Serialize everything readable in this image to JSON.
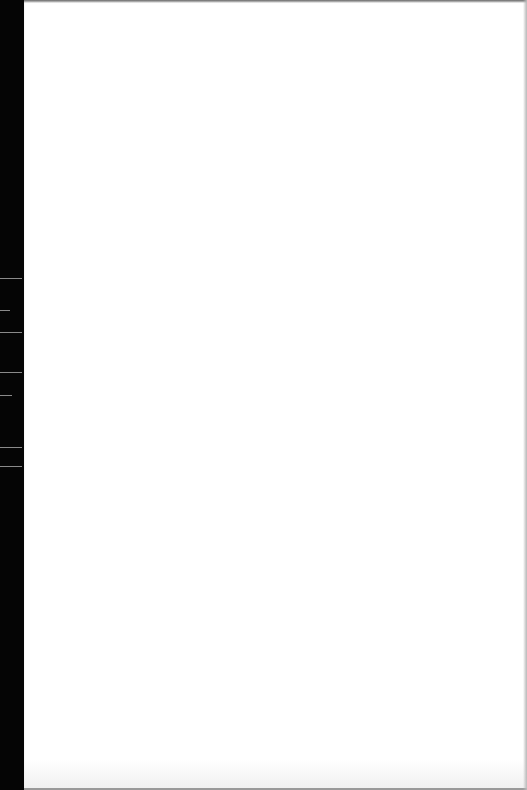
{
  "document": {
    "type": "scanned-page",
    "content": "",
    "page_background": "#ffffff",
    "scan_edge_color": "#050505"
  }
}
